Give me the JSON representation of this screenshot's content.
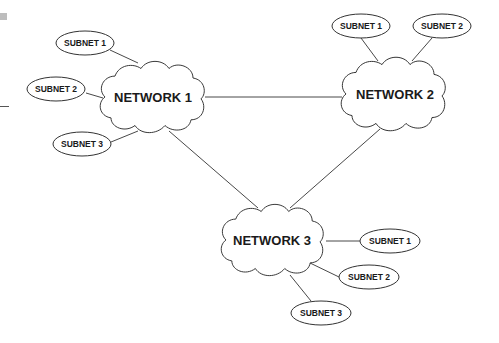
{
  "diagram": {
    "networks": [
      {
        "id": "n1",
        "label": "NETWORK 1",
        "cx": 153,
        "cy": 97
      },
      {
        "id": "n2",
        "label": "NETWORK 2",
        "cx": 394,
        "cy": 94
      },
      {
        "id": "n3",
        "label": "NETWORK 3",
        "cx": 273,
        "cy": 240
      }
    ],
    "subnets": {
      "n1": [
        {
          "label": "SUBNET 1",
          "cx": 85,
          "cy": 43
        },
        {
          "label": "SUBNET 2",
          "cx": 56,
          "cy": 89
        },
        {
          "label": "SUBNET 3",
          "cx": 82,
          "cy": 144
        }
      ],
      "n2": [
        {
          "label": "SUBNET 1",
          "cx": 361,
          "cy": 26
        },
        {
          "label": "SUBNET 2",
          "cx": 442,
          "cy": 26
        }
      ],
      "n3": [
        {
          "label": "SUBNET 1",
          "cx": 390,
          "cy": 241
        },
        {
          "label": "SUBNET 2",
          "cx": 369,
          "cy": 277
        },
        {
          "label": "SUBNET 3",
          "cx": 321,
          "cy": 313
        }
      ]
    },
    "links": [
      {
        "from": "NETWORK 1",
        "to": "NETWORK 2"
      },
      {
        "from": "NETWORK 1",
        "to": "NETWORK 3"
      },
      {
        "from": "NETWORK 2",
        "to": "NETWORK 3"
      }
    ]
  }
}
